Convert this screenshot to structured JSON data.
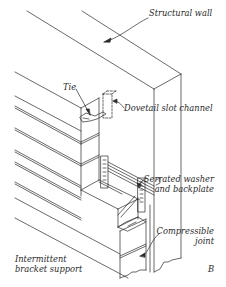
{
  "diagram": {
    "panel_letter": "B",
    "labels": {
      "structural_wall": "Structural wall",
      "tie": "Tie",
      "dovetail_slot_channel": "Dovetail slot channel",
      "serrated_washer_line1": "Serrated washer",
      "serrated_washer_line2": "and backplate",
      "compressible_joint_line1": "Compressible",
      "compressible_joint_line2": "joint",
      "bracket_support_line1": "Intermittent",
      "bracket_support_line2": "bracket support"
    },
    "colors": {
      "line": "#2a2a2a",
      "background": "#ffffff"
    }
  }
}
